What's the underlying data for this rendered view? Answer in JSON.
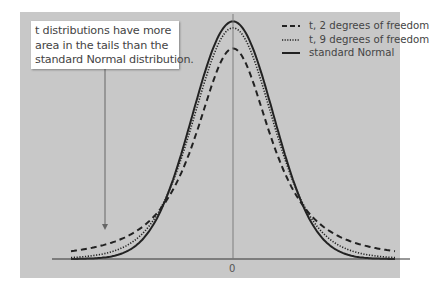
{
  "annotation": {
    "lines": [
      "t distributions have more",
      "area in the tails than the",
      "standard Normal distribution."
    ]
  },
  "legend": {
    "items": [
      {
        "label": "t, 2 degrees of freedom",
        "style": "dashed"
      },
      {
        "label": "t, 9 degrees of freedom",
        "style": "dotted"
      },
      {
        "label": "standard Normal",
        "style": "solid"
      }
    ]
  },
  "axis": {
    "x_tick_label": "0"
  },
  "colors": {
    "panel": "#c8c8c8",
    "curve": "#222222",
    "axis": "#333333",
    "callout_bg": "#ffffff"
  },
  "chart_data": {
    "type": "line",
    "title": "",
    "xlabel": "",
    "ylabel": "",
    "x_ticks": [
      "0"
    ],
    "grid": false,
    "legend_position": "top-right",
    "annotation": "t distributions have more area in the tails than the standard Normal distribution.",
    "x": [
      -4,
      -3,
      -2,
      -1,
      0,
      1,
      2,
      3,
      4
    ],
    "series": [
      {
        "name": "t, 2 degrees of freedom",
        "style": "dashed",
        "values": [
          0.0131,
          0.0274,
          0.068,
          0.1925,
          0.3536,
          0.1925,
          0.068,
          0.0274,
          0.0131
        ]
      },
      {
        "name": "t, 9 degrees of freedom",
        "style": "dotted",
        "values": [
          0.0028,
          0.0114,
          0.0593,
          0.2303,
          0.388,
          0.2303,
          0.0593,
          0.0114,
          0.0028
        ]
      },
      {
        "name": "standard Normal",
        "style": "solid",
        "values": [
          0.0001,
          0.0044,
          0.054,
          0.242,
          0.3989,
          0.242,
          0.054,
          0.0044,
          0.0001
        ]
      }
    ]
  }
}
